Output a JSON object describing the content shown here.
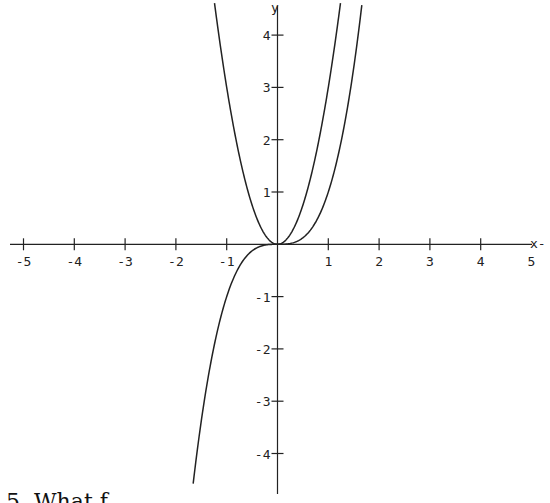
{
  "chart_data": {
    "type": "line",
    "title": "",
    "xlabel": "x",
    "ylabel": "y",
    "xlim": [
      -5,
      5
    ],
    "ylim": [
      -4.6,
      4.6
    ],
    "grid": false,
    "legend": null,
    "x_ticks": [
      -5,
      -4,
      -3,
      -2,
      -1,
      1,
      2,
      3,
      4,
      5
    ],
    "y_ticks": [
      -4,
      -3,
      -2,
      -1,
      1,
      2,
      3,
      4
    ],
    "x_tick_labels": [
      "-5",
      "-4",
      "-3",
      "-2",
      "-1",
      "1",
      "2",
      "3",
      "4",
      "5"
    ],
    "y_tick_labels": [
      "-4",
      "-3",
      "-2",
      "-1",
      "1",
      "2",
      "3",
      "4"
    ],
    "series": [
      {
        "name": "parabola (approx. y = 3x^2)",
        "x": [
          -1.24,
          -1.15,
          -1.0,
          -0.8,
          -0.6,
          -0.4,
          -0.2,
          0,
          0.2,
          0.4,
          0.6,
          0.8,
          1.0,
          1.15,
          1.24
        ],
        "y": [
          4.6,
          3.97,
          3.0,
          1.92,
          1.08,
          0.48,
          0.12,
          0,
          0.12,
          0.48,
          1.08,
          1.92,
          3.0,
          3.97,
          4.6
        ]
      },
      {
        "name": "cubic (y = x^3)",
        "x": [
          -1.66,
          -1.5,
          -1.25,
          -1.0,
          -0.75,
          -0.5,
          -0.25,
          0,
          0.25,
          0.5,
          0.75,
          1.0,
          1.25,
          1.5,
          1.66
        ],
        "y": [
          -4.57,
          -3.38,
          -1.95,
          -1.0,
          -0.42,
          -0.13,
          -0.02,
          0,
          0.02,
          0.13,
          0.42,
          1.0,
          1.95,
          3.38,
          4.57
        ]
      }
    ]
  },
  "axes": {
    "x_name": "x-",
    "y_name": "y"
  },
  "caption": {
    "text": "5.  What f..."
  }
}
